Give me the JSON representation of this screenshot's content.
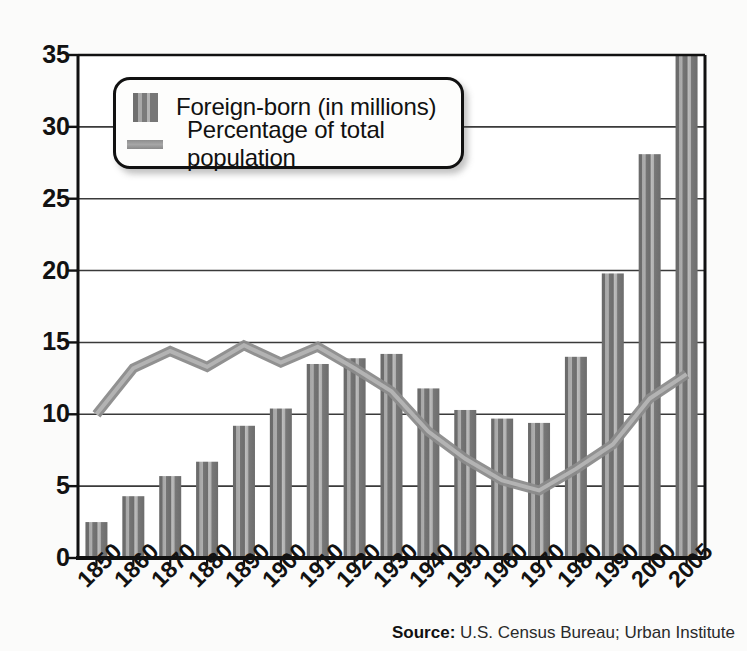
{
  "chart_data": {
    "type": "bar",
    "title": "",
    "xlabel": "",
    "ylabel": "",
    "ylim": [
      0,
      35
    ],
    "ytick_step": 5,
    "grid": true,
    "legend_position": "upper-left-inside",
    "categories": [
      "1850",
      "1860",
      "1870",
      "1880",
      "1890",
      "1900",
      "1910",
      "1920",
      "1930",
      "1940",
      "1950",
      "1960",
      "1970",
      "1980",
      "1990",
      "2000",
      "2005"
    ],
    "yticks": [
      "0",
      "5",
      "10",
      "15",
      "20",
      "25",
      "30",
      "35"
    ],
    "series": [
      {
        "name": "Foreign-born (in millions)",
        "type": "bar",
        "values": [
          2.5,
          4.3,
          5.7,
          6.7,
          9.2,
          10.4,
          13.5,
          13.9,
          14.2,
          11.8,
          10.3,
          9.7,
          9.4,
          14.0,
          19.8,
          28.1,
          35.0
        ]
      },
      {
        "name": "Percentage of total population",
        "type": "line",
        "values": [
          10.0,
          13.2,
          14.4,
          13.3,
          14.8,
          13.6,
          14.7,
          13.2,
          11.6,
          8.8,
          6.9,
          5.4,
          4.7,
          6.2,
          7.9,
          11.1,
          12.8
        ]
      }
    ],
    "source_label": "Source:",
    "source_text": " U.S. Census Bureau; Urban Institute"
  },
  "legend": {
    "bar_label": "Foreign-born (in millions)",
    "line_label": "Percentage of total population"
  },
  "colors": {
    "bar_dark": "#6f6f6f",
    "bar_light": "#b4b4b4",
    "line": "#9a9a9a",
    "axis": "#111111",
    "grid": "#3a3a3a",
    "background": "#fbfbfa",
    "text": "#121212"
  }
}
